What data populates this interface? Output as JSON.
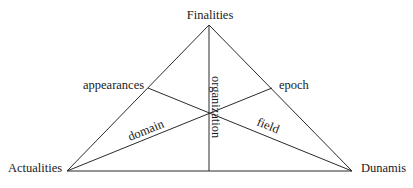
{
  "diagram": {
    "type": "triangle",
    "vertices": {
      "top": "Finalities",
      "left": "Actualities",
      "right": "Dunamis"
    },
    "edge_points": {
      "left_edge": "appearances",
      "right_edge": "epoch"
    },
    "line_labels": {
      "left_lower": "domain",
      "right_lower": "field",
      "vertical": "organization"
    },
    "colors": {
      "line": "#2a2a2a",
      "text": "#1a1a1a",
      "background": "#ffffff"
    }
  }
}
